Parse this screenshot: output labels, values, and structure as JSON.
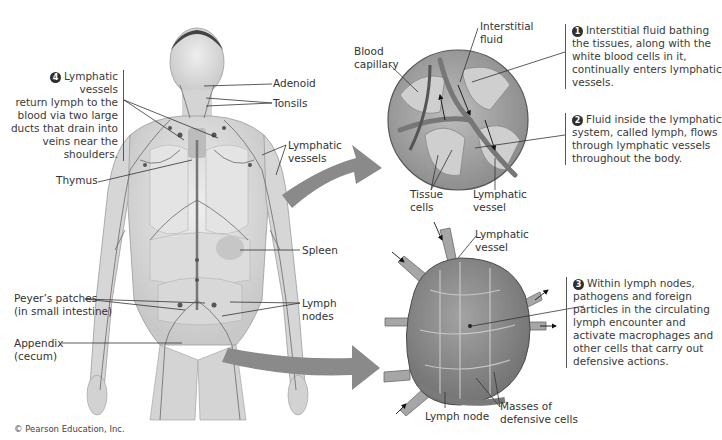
{
  "figure": {
    "copyright": "© Pearson Education, Inc."
  },
  "body_labels": {
    "adenoid": "Adenoid",
    "tonsils": "Tonsils",
    "lymphatic_vessels_1": "Lymphatic",
    "lymphatic_vessels_2": "vessels",
    "thymus": "Thymus",
    "spleen": "Spleen",
    "peyers_1": "Peyer’s patches",
    "peyers_2": "(in small intestine)",
    "lymph_nodes_1": "Lymph",
    "lymph_nodes_2": "nodes",
    "appendix_1": "Appendix",
    "appendix_2": "(cecum)"
  },
  "inset_tissue": {
    "blood_capillary_1": "Blood",
    "blood_capillary_2": "capillary",
    "interstitial_fluid_1": "Interstitial",
    "interstitial_fluid_2": "fluid",
    "tissue_cells_1": "Tissue",
    "tissue_cells_2": "cells",
    "lymphatic_vessel_1": "Lymphatic",
    "lymphatic_vessel_2": "vessel"
  },
  "inset_node": {
    "lymphatic_vessel_1": "Lymphatic",
    "lymphatic_vessel_2": "vessel",
    "lymph_node": "Lymph node",
    "masses_1": "Masses of",
    "masses_2": "defensive cells"
  },
  "callouts": [
    {
      "number": "1",
      "lines": [
        "Interstitial fluid bathing",
        "the tissues, along with the",
        "white blood cells in it,",
        "continually enters lymphatic",
        "vessels."
      ]
    },
    {
      "number": "2",
      "lines": [
        "Fluid inside the lymphatic",
        "system, called lymph, flows",
        "through lymphatic vessels",
        "throughout the body."
      ]
    },
    {
      "number": "3",
      "lines": [
        "Within lymph nodes,",
        "pathogens and foreign",
        "particles in the circulating",
        "lymph encounter and",
        "activate macrophages and",
        "other cells that carry out",
        "defensive actions."
      ]
    },
    {
      "number": "4",
      "lines": [
        "Lymphatic vessels",
        "return lymph to the",
        "blood via two large",
        "ducts that drain into",
        "veins near the",
        "shoulders."
      ]
    }
  ],
  "colors": {
    "skin": "#d9d9d9",
    "vessel": "#6a6a6a",
    "arrow": "#8a8a8a",
    "tissue": "#a8a8a8",
    "node": "#8e8e8e"
  }
}
